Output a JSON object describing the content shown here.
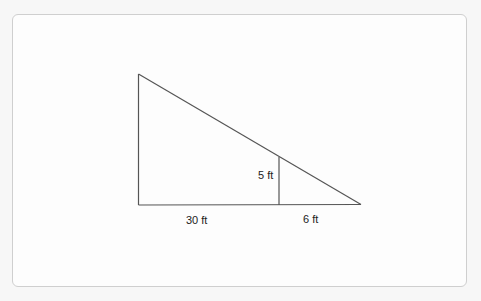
{
  "diagram": {
    "type": "similar-triangles",
    "labels": {
      "inner_height": "5 ft",
      "left_base": "30 ft",
      "right_base": "6 ft"
    },
    "colors": {
      "stroke": "#555555",
      "text": "#222222",
      "card_border": "#cfcfcf",
      "card_bg": "#fdfdfd"
    }
  }
}
